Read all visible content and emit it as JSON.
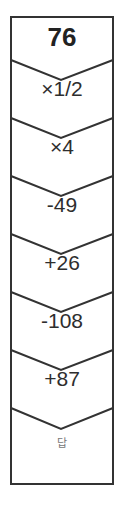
{
  "puzzle": {
    "start_value": "76",
    "steps": [
      {
        "label": "×1/2"
      },
      {
        "label": "×4"
      },
      {
        "label": "-49"
      },
      {
        "label": "+26"
      },
      {
        "label": "-108"
      },
      {
        "label": "+87"
      }
    ],
    "answer_label": "답",
    "colors": {
      "border": "#333333",
      "text": "#222222",
      "answer_text": "#777777"
    }
  }
}
